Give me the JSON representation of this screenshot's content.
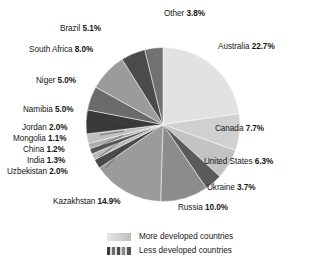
{
  "chart_data": {
    "type": "pie",
    "title": "",
    "unit": "percent",
    "start_angle_deg": 0,
    "direction": "clockwise",
    "legend_position": "bottom",
    "categories": [
      "Australia",
      "Canada",
      "United States",
      "Ukraine",
      "Russia",
      "Kazakhstan",
      "Uzbekistan",
      "India",
      "China",
      "Mongolia",
      "Jordan",
      "Namibia",
      "Niger",
      "South Africa",
      "Brazil",
      "Other"
    ],
    "values": [
      22.7,
      7.7,
      6.3,
      3.7,
      10.0,
      14.9,
      2.0,
      1.3,
      1.2,
      1.1,
      2.0,
      5.0,
      5.0,
      8.0,
      5.1,
      3.8
    ],
    "labels": [
      "Australia 22.7%",
      "Canada 7.7%",
      "United States 6.3%",
      "Ukraine 3.7%",
      "Russia 10.0%",
      "Kazakhstan 14.9%",
      "Uzbekistan 2.0%",
      "India 1.3%",
      "China 1.2%",
      "Mongolia 1.1%",
      "Jordan 2.0%",
      "Namibia 5.0%",
      "Niger 5.0%",
      "South Africa 8.0%",
      "Brazil 5.1%",
      "Other 3.8%"
    ],
    "slice_colors": [
      "#e2e2e2",
      "#d0d0d0",
      "#c3c3c3",
      "#5a5a5a",
      "#8c8c8c",
      "#9b9b9b",
      "#4a4a4a",
      "#b9b9b9",
      "#565656",
      "#ababab",
      "#bfbfbf",
      "#3a3a3a",
      "#6b6b6b",
      "#9b9b9b",
      "#4b4b4b",
      "#717171"
    ],
    "groups": {
      "more_developed": [
        "Australia",
        "Canada",
        "United States"
      ],
      "less_developed": [
        "Ukraine",
        "Russia",
        "Kazakhstan",
        "Uzbekistan",
        "India",
        "China",
        "Mongolia",
        "Jordan",
        "Namibia",
        "Niger",
        "South Africa",
        "Brazil",
        "Other"
      ]
    },
    "legend": [
      {
        "key": "more-developed",
        "label": "More developed countries"
      },
      {
        "key": "less-developed",
        "label": "Less developed countries"
      }
    ]
  },
  "slices": [
    {
      "name": "Australia",
      "text_name": "Australia",
      "text_value": "22.7%",
      "color": "#e2e2e2"
    },
    {
      "name": "Canada",
      "text_name": "Canada",
      "text_value": "7.7%",
      "color": "#d0d0d0"
    },
    {
      "name": "United States",
      "text_name": "United States",
      "text_value": "6.3%",
      "color": "#c3c3c3"
    },
    {
      "name": "Ukraine",
      "text_name": "Ukraine",
      "text_value": "3.7%",
      "color": "#5a5a5a"
    },
    {
      "name": "Russia",
      "text_name": "Russia",
      "text_value": "10.0%",
      "color": "#8c8c8c"
    },
    {
      "name": "Kazakhstan",
      "text_name": "Kazakhstan",
      "text_value": "14.9%",
      "color": "#9b9b9b"
    },
    {
      "name": "Uzbekistan",
      "text_name": "Uzbekistan",
      "text_value": "2.0%",
      "color": "#4a4a4a"
    },
    {
      "name": "India",
      "text_name": "India",
      "text_value": "1.3%",
      "color": "#b9b9b9"
    },
    {
      "name": "China",
      "text_name": "China",
      "text_value": "1.2%",
      "color": "#565656"
    },
    {
      "name": "Mongolia",
      "text_name": "Mongolia",
      "text_value": "1.1%",
      "color": "#ababab"
    },
    {
      "name": "Jordan",
      "text_name": "Jordan",
      "text_value": "2.0%",
      "color": "#bfbfbf"
    },
    {
      "name": "Namibia",
      "text_name": "Namibia",
      "text_value": "5.0%",
      "color": "#3a3a3a"
    },
    {
      "name": "Niger",
      "text_name": "Niger",
      "text_value": "5.0%",
      "color": "#6b6b6b"
    },
    {
      "name": "South Africa",
      "text_name": "South Africa",
      "text_value": "8.0%",
      "color": "#9b9b9b"
    },
    {
      "name": "Brazil",
      "text_name": "Brazil",
      "text_value": "5.1%",
      "color": "#4b4b4b"
    },
    {
      "name": "Other",
      "text_name": "Other",
      "text_value": "3.8%",
      "color": "#717171"
    }
  ],
  "legend": {
    "more_developed_label": "More developed countries",
    "less_developed_label": "Less developed countries"
  }
}
